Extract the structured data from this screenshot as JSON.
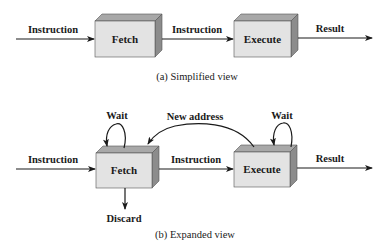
{
  "colors": {
    "front": "#e3e3e3",
    "top": "#a8a8a8",
    "side": "#8c8c8c",
    "stroke": "#1a1a1a"
  },
  "simplified": {
    "caption": "(a) Simplified view",
    "input_label": "Instruction",
    "fetch_label": "Fetch",
    "mid_label": "Instruction",
    "execute_label": "Execute",
    "output_label": "Result"
  },
  "expanded": {
    "caption": "(b) Expanded view",
    "input_label": "Instruction",
    "fetch_label": "Fetch",
    "mid_label": "Instruction",
    "execute_label": "Execute",
    "output_label": "Result",
    "fetch_wait_label": "Wait",
    "execute_wait_label": "Wait",
    "feedback_label": "New address",
    "discard_label": "Discard"
  }
}
